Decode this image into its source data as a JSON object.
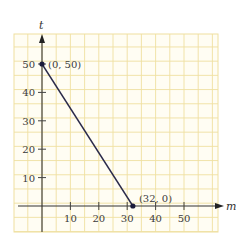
{
  "chart_data": {
    "type": "line",
    "title": "",
    "xlabel": "m",
    "ylabel": "t",
    "x_ticks": [
      "10",
      "20",
      "30",
      "40",
      "50"
    ],
    "y_ticks": [
      "10",
      "20",
      "30",
      "40",
      "50"
    ],
    "xlim": [
      -10,
      60
    ],
    "ylim": [
      -10,
      55
    ],
    "grid": true,
    "grid_color": "#efe0a0",
    "line_color": "#2a2a4a",
    "series": [
      {
        "name": "line",
        "x": [
          0,
          32
        ],
        "y": [
          50,
          0
        ]
      }
    ],
    "annotations": [
      {
        "text": "(0, 50)",
        "x": 0,
        "y": 50
      },
      {
        "text": "(32, 0)",
        "x": 32,
        "y": 0
      }
    ]
  }
}
